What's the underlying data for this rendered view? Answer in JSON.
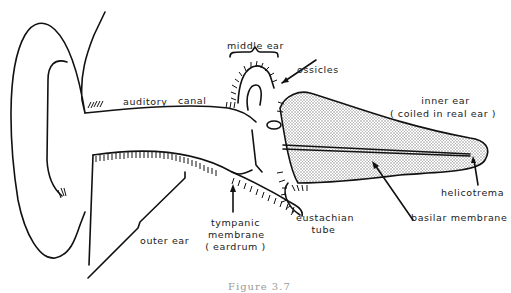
{
  "diagram": {
    "caption": "Figure 3.7",
    "labels": {
      "middle_ear": "middle ear",
      "ossicles": "ossicles",
      "auditory_canal_1": "auditory",
      "auditory_canal_2": "canal",
      "inner_ear_1": "inner ear",
      "inner_ear_2": "( coiled in real ear )",
      "helicotrema": "helicotrema",
      "basilar_membrane": "basilar membrane",
      "eustachian_tube_1": "eustachian",
      "eustachian_tube_2": "tube",
      "tympanic_1": "tympanic",
      "tympanic_2": "membrane",
      "tympanic_3": "( eardrum )",
      "outer_ear": "outer ear"
    },
    "colors": {
      "line": "#111111",
      "inner_ear_fill": "#d8d8d8",
      "background": "#ffffff"
    }
  }
}
